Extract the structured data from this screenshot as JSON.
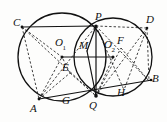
{
  "figure": {
    "canvas": {
      "width": 167,
      "height": 122
    },
    "stroke_color": "#111111",
    "background_color": "#fdfdfc",
    "labels": [
      {
        "id": "C",
        "text": "C",
        "sub": "",
        "x": 13,
        "y": 17
      },
      {
        "id": "P",
        "text": "P",
        "sub": "",
        "x": 95,
        "y": 12
      },
      {
        "id": "D",
        "text": "D",
        "sub": "",
        "x": 146,
        "y": 15
      },
      {
        "id": "O1",
        "text": "O",
        "sub": "1",
        "x": 55,
        "y": 38
      },
      {
        "id": "M",
        "text": "M",
        "sub": "",
        "x": 80,
        "y": 41
      },
      {
        "id": "O2",
        "text": "O",
        "sub": "2",
        "x": 104,
        "y": 40
      },
      {
        "id": "F",
        "text": "F",
        "sub": "",
        "x": 117,
        "y": 36
      },
      {
        "id": "E",
        "text": "E",
        "sub": "",
        "x": 62,
        "y": 63
      },
      {
        "id": "B",
        "text": "B",
        "sub": "",
        "x": 152,
        "y": 74
      },
      {
        "id": "H",
        "text": "H",
        "sub": "",
        "x": 117,
        "y": 88
      },
      {
        "id": "G",
        "text": "G",
        "sub": "",
        "x": 62,
        "y": 96
      },
      {
        "id": "Q",
        "text": "Q",
        "sub": "",
        "x": 90,
        "y": 100
      },
      {
        "id": "A",
        "text": "A",
        "sub": "",
        "x": 30,
        "y": 103
      }
    ],
    "circles": [
      {
        "id": "circle-O1",
        "cx": 62,
        "cy": 57,
        "r": 44,
        "style": "solid"
      },
      {
        "id": "circle-O2",
        "cx": 113,
        "cy": 57,
        "r": 39,
        "style": "solid"
      }
    ],
    "points": {
      "C": {
        "x": 22,
        "y": 27
      },
      "P": {
        "x": 96,
        "y": 26
      },
      "D": {
        "x": 147,
        "y": 28
      },
      "O1": {
        "x": 62,
        "y": 57
      },
      "M": {
        "x": 87,
        "y": 51
      },
      "O2": {
        "x": 113,
        "y": 57
      },
      "F": {
        "x": 121,
        "y": 48
      },
      "E": {
        "x": 70,
        "y": 73
      },
      "B": {
        "x": 149,
        "y": 81
      },
      "H": {
        "x": 124,
        "y": 90
      },
      "G": {
        "x": 72,
        "y": 96
      },
      "Q": {
        "x": 96,
        "y": 96
      },
      "A": {
        "x": 39,
        "y": 99
      }
    },
    "solid_segments": [
      {
        "id": "seg-CP",
        "from": "C",
        "to": "P"
      },
      {
        "id": "seg-AB",
        "from": "A",
        "to": "B"
      },
      {
        "id": "seg-O1O2",
        "from": "O1",
        "to": "O2"
      },
      {
        "id": "seg-PQ",
        "from": "P",
        "to": "Q"
      },
      {
        "id": "seg-MQ",
        "from": "M",
        "to": "Q"
      },
      {
        "id": "seg-MP",
        "from": "M",
        "to": "P"
      }
    ],
    "dashed_segments": [
      {
        "id": "seg-PD",
        "from": "P",
        "to": "D"
      },
      {
        "id": "seg-CA",
        "from": "C",
        "to": "A"
      },
      {
        "id": "seg-CQ",
        "from": "C",
        "to": "Q"
      },
      {
        "id": "seg-CO1",
        "from": "C",
        "to": "O1"
      },
      {
        "id": "seg-AP",
        "from": "A",
        "to": "P"
      },
      {
        "id": "seg-AE",
        "from": "A",
        "to": "E"
      },
      {
        "id": "seg-AO1",
        "from": "A",
        "to": "O1"
      },
      {
        "id": "seg-EO1",
        "from": "E",
        "to": "O1"
      },
      {
        "id": "seg-EQ",
        "from": "E",
        "to": "Q"
      },
      {
        "id": "seg-DQ",
        "from": "D",
        "to": "Q"
      },
      {
        "id": "seg-DB",
        "from": "D",
        "to": "B"
      },
      {
        "id": "seg-DH",
        "from": "D",
        "to": "H"
      },
      {
        "id": "seg-PB",
        "from": "P",
        "to": "B"
      },
      {
        "id": "seg-PH",
        "from": "P",
        "to": "H"
      },
      {
        "id": "seg-QF",
        "from": "Q",
        "to": "F"
      },
      {
        "id": "seg-FB",
        "from": "F",
        "to": "B"
      },
      {
        "id": "seg-QO2",
        "from": "Q",
        "to": "O2"
      }
    ],
    "dot_markers": [
      "O1",
      "O2",
      "C",
      "P",
      "D",
      "A",
      "B",
      "Q"
    ]
  }
}
